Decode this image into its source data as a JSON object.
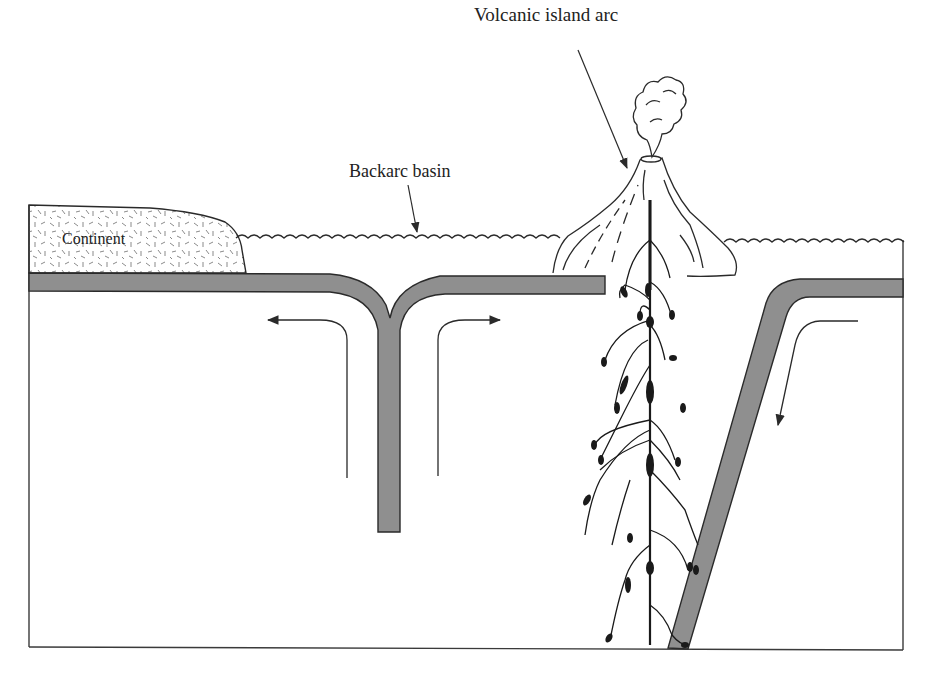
{
  "diagram": {
    "type": "cross-section",
    "labels": {
      "volcanic_island_arc": "Volcanic island arc",
      "backarc_basin": "Backarc basin",
      "continent": "Continent"
    },
    "colors": {
      "plate_fill": "#8f8f8f",
      "outline": "#2a2a2a",
      "background": "#ffffff",
      "continent_texture": "#8a8a8a",
      "magma": "#1a1a1a"
    },
    "elements": [
      {
        "id": "continent",
        "label": "Continent",
        "kind": "textured block"
      },
      {
        "id": "sea-surface",
        "kind": "wavy line"
      },
      {
        "id": "backarc-spreading-slab",
        "kind": "T-shaped plate (downwelling)"
      },
      {
        "id": "volcano",
        "label": "Volcanic island arc",
        "kind": "volcano with eruption cloud"
      },
      {
        "id": "magma-conduits",
        "kind": "branching feeders with droplets"
      },
      {
        "id": "subducting-slab",
        "kind": "dipping plate"
      },
      {
        "id": "convection-arrows",
        "count": 3
      }
    ]
  }
}
